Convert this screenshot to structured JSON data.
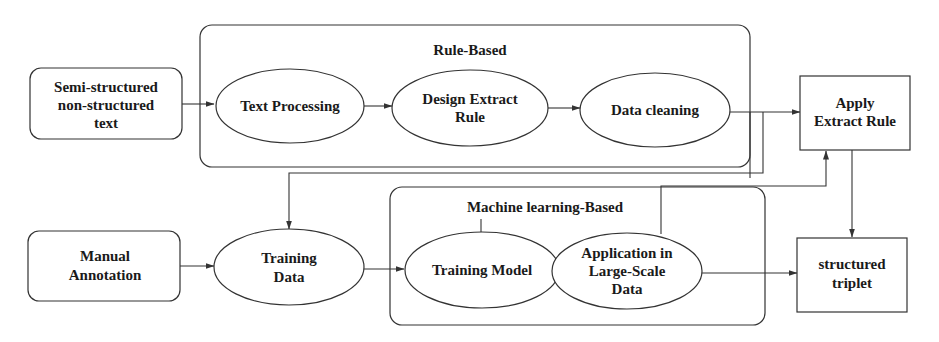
{
  "groups": {
    "rule_based": {
      "title": "Rule-Based"
    },
    "ml_based": {
      "title": "Machine learning-Based"
    }
  },
  "nodes": {
    "semi_structured": {
      "lines": [
        "Semi-structured",
        "non-structured",
        "text"
      ]
    },
    "text_processing": {
      "lines": [
        "Text Processing"
      ]
    },
    "design_extract_rule": {
      "lines": [
        "Design Extract",
        "Rule"
      ]
    },
    "data_cleaning": {
      "lines": [
        "Data cleaning"
      ]
    },
    "apply_extract_rule": {
      "lines": [
        "Apply",
        "Extract Rule"
      ]
    },
    "manual_annotation": {
      "lines": [
        "Manual",
        "Annotation"
      ]
    },
    "training_data": {
      "lines": [
        "Training",
        "Data"
      ]
    },
    "training_model": {
      "lines": [
        "Training Model"
      ]
    },
    "application_large_scale": {
      "lines": [
        "Application in",
        "Large-Scale",
        "Data"
      ]
    },
    "structured_triplet": {
      "lines": [
        "structured",
        "triplet"
      ]
    }
  },
  "edges": [
    {
      "from": "semi_structured",
      "to": "text_processing"
    },
    {
      "from": "text_processing",
      "to": "design_extract_rule"
    },
    {
      "from": "design_extract_rule",
      "to": "data_cleaning"
    },
    {
      "from": "data_cleaning",
      "to": "apply_extract_rule"
    },
    {
      "from": "data_cleaning",
      "to": "training_data"
    },
    {
      "from": "manual_annotation",
      "to": "training_data"
    },
    {
      "from": "training_data",
      "to": "training_model"
    },
    {
      "from": "training_model",
      "to": "application_large_scale"
    },
    {
      "from": "application_large_scale",
      "to": "apply_extract_rule"
    },
    {
      "from": "application_large_scale",
      "to": "structured_triplet"
    },
    {
      "from": "apply_extract_rule",
      "to": "structured_triplet"
    }
  ]
}
